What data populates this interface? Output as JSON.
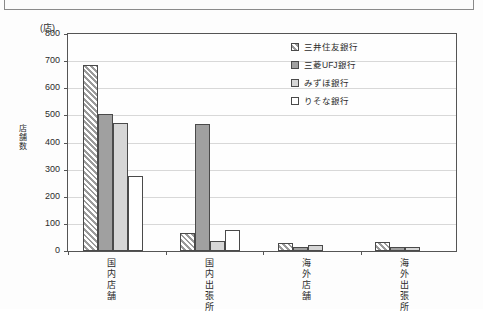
{
  "header": {
    "chip_label": "",
    "strip_name": "cropped-header-box"
  },
  "figure": {
    "unit_label": "(店)",
    "y_axis_title": "店舗数"
  },
  "chart_data": {
    "type": "bar",
    "title": "",
    "xlabel": "",
    "ylabel": "店舗数",
    "unit": "(店)",
    "ylim": [
      0,
      800
    ],
    "yticks": [
      0,
      100,
      200,
      300,
      400,
      500,
      600,
      700,
      800
    ],
    "grid": true,
    "legend_position": "top-right",
    "categories": [
      "国内店舗",
      "国内出張所",
      "海外店舗",
      "海外出張所"
    ],
    "series": [
      {
        "name": "三井住友銀行",
        "fill": "hatch",
        "color": "#9a9a9a",
        "values": [
          685,
          65,
          30,
          35
        ]
      },
      {
        "name": "三菱UFJ銀行",
        "fill": "solid",
        "color": "#a0a0a0",
        "values": [
          505,
          468,
          15,
          15
        ]
      },
      {
        "name": "みずほ銀行",
        "fill": "solid",
        "color": "#d6d6d6",
        "values": [
          472,
          38,
          23,
          15
        ]
      },
      {
        "name": "りそな銀行",
        "fill": "solid",
        "color": "#ffffff",
        "values": [
          275,
          78,
          0,
          0
        ]
      }
    ]
  }
}
